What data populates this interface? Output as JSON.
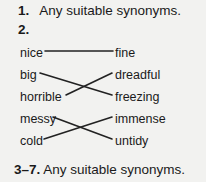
{
  "page": {
    "background_color": "#f2f2f0",
    "text_color": "#1a1a1a",
    "line_color": "#222222"
  },
  "answers": {
    "item1": {
      "number": "1.",
      "text": "Any suitable synonyms."
    },
    "item2": {
      "number": "2.",
      "text": ""
    },
    "item37": {
      "number": "3–7.",
      "text": "Any suitable synonyms."
    }
  },
  "matching_exercise": {
    "left_words": [
      "nice",
      "big",
      "horrible",
      "messy",
      "cold"
    ],
    "right_words": [
      "fine",
      "dreadful",
      "freezing",
      "immense",
      "untidy"
    ],
    "connections": [
      {
        "from": "nice",
        "to": "fine",
        "from_row": 0,
        "to_row": 0
      },
      {
        "from": "big",
        "to": "freezing",
        "from_row": 1,
        "to_row": 2
      },
      {
        "from": "horrible",
        "to": "dreadful",
        "from_row": 2,
        "to_row": 1
      },
      {
        "from": "messy",
        "to": "untidy",
        "from_row": 3,
        "to_row": 4
      },
      {
        "from": "cold",
        "to": "immense",
        "from_row": 4,
        "to_row": 3
      }
    ]
  }
}
